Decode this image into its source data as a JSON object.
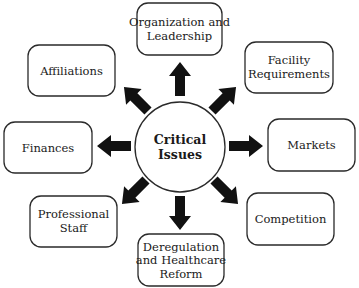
{
  "diagram": {
    "type": "hub-and-spoke",
    "center": {
      "label_line1": "Critical",
      "label_line2": "Issues"
    },
    "nodes": [
      {
        "id": "organization",
        "line1": "Organization and",
        "line2": "Leadership",
        "line3": ""
      },
      {
        "id": "facility",
        "line1": "Facility",
        "line2": "Requirements",
        "line3": ""
      },
      {
        "id": "markets",
        "line1": "Markets",
        "line2": "",
        "line3": ""
      },
      {
        "id": "competition",
        "line1": "Competition",
        "line2": "",
        "line3": ""
      },
      {
        "id": "deregulation",
        "line1": "Deregulation",
        "line2": "and Healthcare",
        "line3": "Reform"
      },
      {
        "id": "professional-staff",
        "line1": "Professional",
        "line2": "Staff",
        "line3": ""
      },
      {
        "id": "finances",
        "line1": "Finances",
        "line2": "",
        "line3": ""
      },
      {
        "id": "affiliations",
        "line1": "Affiliations",
        "line2": "",
        "line3": ""
      }
    ],
    "edges": [
      {
        "from": "center",
        "to": "organization"
      },
      {
        "from": "center",
        "to": "facility"
      },
      {
        "from": "center",
        "to": "markets"
      },
      {
        "from": "center",
        "to": "competition"
      },
      {
        "from": "center",
        "to": "deregulation"
      },
      {
        "from": "center",
        "to": "professional-staff"
      },
      {
        "from": "center",
        "to": "finances"
      },
      {
        "from": "center",
        "to": "affiliations"
      }
    ]
  }
}
